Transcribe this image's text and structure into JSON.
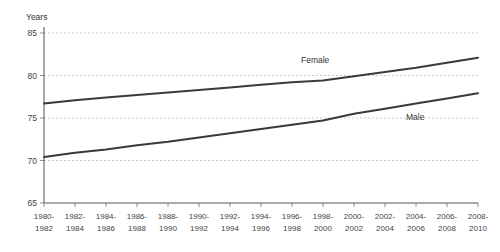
{
  "chart_data": {
    "type": "line",
    "title": "",
    "xlabel": "",
    "ylabel": "Years",
    "ylim": [
      65,
      85
    ],
    "yticks": [
      65,
      70,
      75,
      80,
      85
    ],
    "grid": true,
    "legend_position": "inline-on-lines",
    "categories": [
      "1980-1982",
      "1982-1984",
      "1984-1986",
      "1986-1988",
      "1988-1990",
      "1990-1992",
      "1992-1994",
      "1994-1996",
      "1996-1998",
      "1998-2000",
      "2000-2002",
      "2002-2004",
      "2004-2006",
      "2006-2008",
      "2008-2010"
    ],
    "series": [
      {
        "name": "Female",
        "values": [
          76.7,
          77.1,
          77.4,
          77.7,
          78.0,
          78.3,
          78.6,
          78.9,
          79.2,
          79.4,
          79.9,
          80.4,
          80.9,
          81.5,
          82.1
        ]
      },
      {
        "name": "Male",
        "values": [
          70.4,
          70.9,
          71.3,
          71.8,
          72.2,
          72.7,
          73.2,
          73.7,
          74.2,
          74.7,
          75.5,
          76.1,
          76.7,
          77.3,
          77.9
        ]
      }
    ]
  },
  "axis": {
    "y_title": "Years",
    "y_tick_labels": [
      "85",
      "80",
      "75",
      "70",
      "65"
    ]
  },
  "labels": {
    "female": "Female",
    "male": "Male"
  }
}
